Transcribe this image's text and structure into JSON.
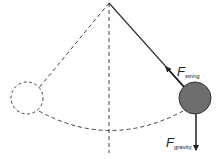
{
  "diagram": {
    "title": "",
    "type": "pendulum-free-body",
    "labels": {
      "force_string": {
        "symbol": "F",
        "subscript": "string"
      },
      "force_gravity": {
        "symbol": "F",
        "subscript": "gravity"
      }
    },
    "elements": [
      {
        "name": "pivot",
        "description": "fixed suspension point"
      },
      {
        "name": "vertical-reference",
        "style": "dashed"
      },
      {
        "name": "string-left",
        "style": "dashed",
        "description": "string at opposite extreme"
      },
      {
        "name": "string-right",
        "style": "solid"
      },
      {
        "name": "bob-ghost",
        "style": "dashed outline",
        "description": "bob position at left extreme"
      },
      {
        "name": "bob",
        "style": "filled",
        "description": "pendulum bob at right extreme"
      },
      {
        "name": "swing-arc",
        "style": "dashed",
        "description": "path of bob"
      },
      {
        "name": "arrow-string",
        "description": "tension force along string toward pivot"
      },
      {
        "name": "arrow-gravity",
        "description": "gravity force downward"
      }
    ],
    "colors": {
      "line": "#333333",
      "bob_fill": "#6e6e6e",
      "bob_stroke": "#333333",
      "background": "#ffffff"
    }
  }
}
